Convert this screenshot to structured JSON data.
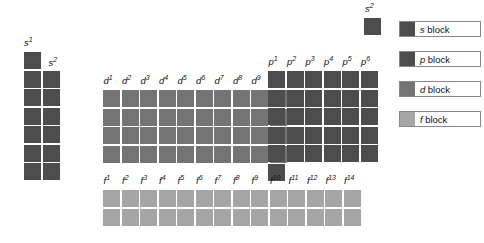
{
  "diagram": {
    "colors": {
      "s_block": "#4d4d4d",
      "p_block": "#4d4d4d",
      "d_block": "#747474",
      "f_block": "#a5a5a5",
      "background": "#ffffff",
      "text": "#111111"
    },
    "blocks": {
      "s": {
        "name": "s block",
        "columns": 2,
        "column_labels": [
          "s1",
          "s2"
        ],
        "column_label_base": [
          "s",
          "s"
        ],
        "column_label_sup": [
          "1",
          "2"
        ],
        "column_rows": [
          7,
          6
        ],
        "detached_cell_label": "s2",
        "detached_cell_base": "s",
        "detached_cell_sup": "2"
      },
      "d": {
        "name": "d block",
        "columns": 10,
        "rows": 4,
        "column_label_base": [
          "d",
          "d",
          "d",
          "d",
          "d",
          "d",
          "d",
          "d",
          "d",
          "d"
        ],
        "column_label_sup": [
          "1",
          "2",
          "3",
          "4",
          "5",
          "6",
          "7",
          "8",
          "9",
          "10"
        ]
      },
      "p": {
        "name": "p block",
        "columns": 6,
        "rows": 5,
        "extra_cell_column": 1,
        "column_label_base": [
          "p",
          "p",
          "p",
          "p",
          "p",
          "p"
        ],
        "column_label_sup": [
          "1",
          "2",
          "3",
          "4",
          "5",
          "6"
        ]
      },
      "f": {
        "name": "f block",
        "columns": 14,
        "rows": 2,
        "column_label_base": [
          "f",
          "f",
          "f",
          "f",
          "f",
          "f",
          "f",
          "f",
          "f",
          "f",
          "f",
          "f",
          "f",
          "f"
        ],
        "column_label_sup": [
          "1",
          "2",
          "3",
          "4",
          "5",
          "6",
          "7",
          "8",
          "9",
          "10",
          "11",
          "12",
          "13",
          "14"
        ]
      }
    }
  },
  "legend": {
    "items": [
      {
        "orbital": "s",
        "label": "block",
        "swatch": "s"
      },
      {
        "orbital": "p",
        "label": "block",
        "swatch": "p"
      },
      {
        "orbital": "d",
        "label": "block",
        "swatch": "d"
      },
      {
        "orbital": "f",
        "label": "block",
        "swatch": "f"
      }
    ]
  }
}
